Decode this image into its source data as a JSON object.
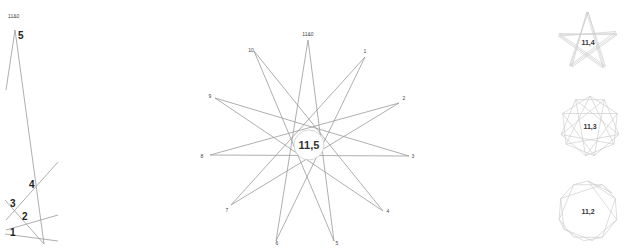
{
  "left_panel": {
    "top_label": "11&0",
    "step_labels": [
      "5",
      "4",
      "3",
      "2",
      "1"
    ]
  },
  "main_star": {
    "label": "11,5",
    "vertex_labels": [
      "11&0",
      "1",
      "2",
      "3",
      "4",
      "5",
      "6",
      "7",
      "8",
      "9",
      "10"
    ]
  },
  "thumbnails": [
    {
      "label": "11,4"
    },
    {
      "label": "11,3"
    },
    {
      "label": "11,2"
    }
  ]
}
